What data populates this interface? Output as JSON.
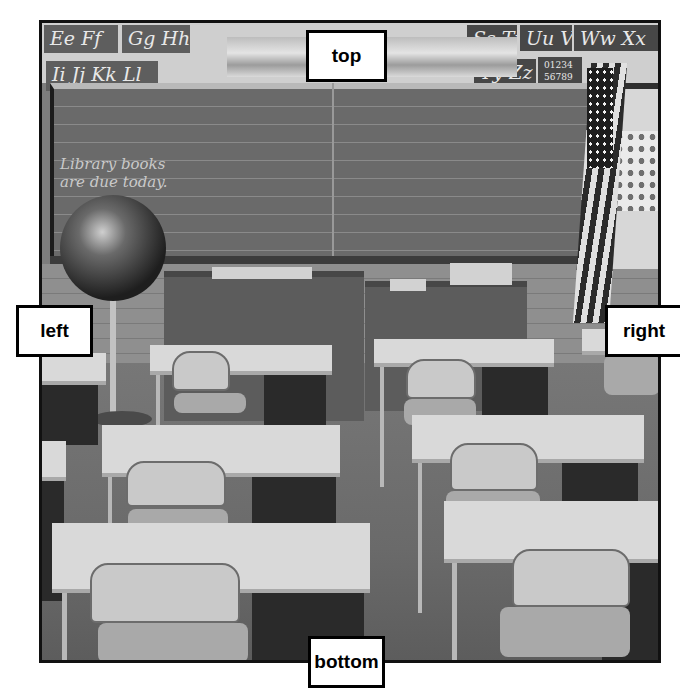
{
  "image": {
    "description": "Black-and-white photo of an empty classroom with rows of student desks and chairs, a teacher's desk, a chalkboard, a globe, and an American flag",
    "frame_color": "#111111",
    "background_color": "#ffffff"
  },
  "scene": {
    "alphabet_cards_top_left": [
      "Ee Ff",
      "Gg Hh"
    ],
    "alphabet_cards_second_left": [
      "Ii Jj Kk Ll"
    ],
    "alphabet_cards_top_right": [
      "Ss Tt",
      "Uu Vv",
      "Ww Xx"
    ],
    "alphabet_cards_second_right": [
      "Yy Zz",
      "01234 56789"
    ],
    "chalkboard_text": [
      "Library books",
      "are due today."
    ]
  },
  "labels": {
    "top": "top",
    "left": "left",
    "right": "right",
    "bottom": "bottom"
  }
}
